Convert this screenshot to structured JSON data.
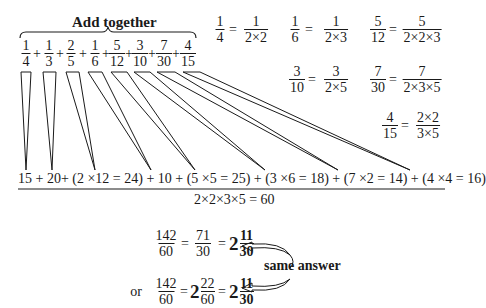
{
  "title": "Add together",
  "sum_fractions": [
    {
      "num": "1",
      "den": "4"
    },
    {
      "num": "1",
      "den": "3"
    },
    {
      "num": "2",
      "den": "5"
    },
    {
      "num": "1",
      "den": "6"
    },
    {
      "num": "5",
      "den": "12"
    },
    {
      "num": "3",
      "den": "10"
    },
    {
      "num": "7",
      "den": "30"
    },
    {
      "num": "4",
      "den": "15"
    }
  ],
  "plus": "+",
  "equals": "=",
  "factorizations": [
    {
      "num": "1",
      "den": "4",
      "fnum": "1",
      "fden": "2×2"
    },
    {
      "num": "1",
      "den": "6",
      "fnum": "1",
      "fden": "2×3"
    },
    {
      "num": "5",
      "den": "12",
      "fnum": "5",
      "fden": "2×2×3"
    },
    {
      "num": "3",
      "den": "10",
      "fnum": "3",
      "fden": "2×5"
    },
    {
      "num": "7",
      "den": "30",
      "fnum": "7",
      "fden": "2×3×5"
    },
    {
      "num": "4",
      "den": "15",
      "fnum": "2×2",
      "fden": "3×5"
    }
  ],
  "numerator_expression": "15 + 20+ (2 ×12 = 24) + 10 + (5 ×5 = 25) + (3 ×6 = 18) + (7 ×2 = 14) + (4 ×4 = 16)",
  "denominator_expression": "2×2×3×5 = 60",
  "result_line1": {
    "f1": {
      "num": "142",
      "den": "60"
    },
    "f2": {
      "num": "71",
      "den": "30"
    },
    "mixed": {
      "whole": "2",
      "num": "11",
      "den": "30"
    }
  },
  "result_line2": {
    "prefix": "or",
    "f1": {
      "num": "142",
      "den": "60"
    },
    "mixed1": {
      "whole": "2",
      "num": "22",
      "den": "60"
    },
    "mixed2": {
      "whole": "2",
      "num": "11",
      "den": "30"
    }
  },
  "annotation": "same answer"
}
